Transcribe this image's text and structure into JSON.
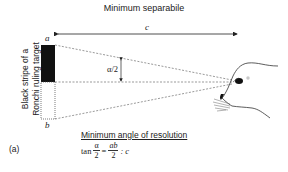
{
  "title": "Minimum separabile",
  "labels": {
    "distance": "c",
    "top": "a",
    "bottom": "b",
    "angle": "α/2",
    "side_line1": "Black stripe of a",
    "side_line2": "Ronchi ruling target",
    "panel": "(a)"
  },
  "resolution": {
    "title": "Minimum angle of resolution",
    "tan": "tan",
    "alpha": "α",
    "two": "2",
    "eq": "=",
    "ab": "ab",
    "two_b": "2",
    "ratio": ": c"
  }
}
